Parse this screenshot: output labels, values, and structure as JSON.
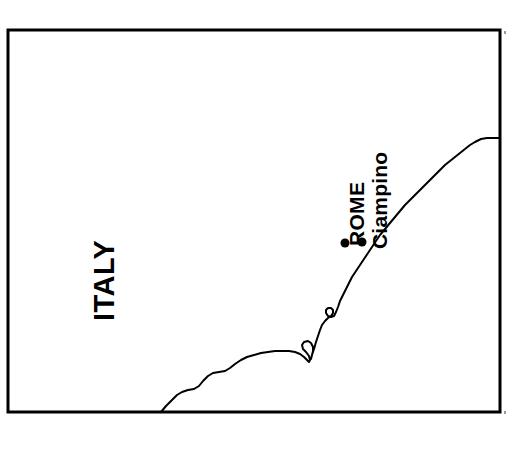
{
  "figure": {
    "type": "map",
    "background_color": "#ffffff",
    "line_color": "#000000",
    "width": 526,
    "height": 459
  },
  "frame": {
    "name": "map-border",
    "x": 8,
    "y": 30,
    "width": 492,
    "height": 382,
    "stroke_width": 3,
    "stroke_color": "#000000"
  },
  "labels": {
    "country": "ITALY",
    "city": "ROME",
    "airport": "Ciampino"
  },
  "markers": [
    {
      "name": "rome-marker",
      "label": "ROME",
      "x": 345,
      "y": 243,
      "radius": 4.5
    },
    {
      "name": "ciampino-marker",
      "label": "Ciampino",
      "x": 362,
      "y": 242,
      "radius": 4.5
    }
  ],
  "coastline": {
    "name": "tyrrhenian-coastline",
    "stroke_width": 2,
    "stroke_color": "#000000",
    "description": "Tyrrhenian coast of central Italy running from the lower-left border up to the right border",
    "points": [
      [
        161,
        412
      ],
      [
        166,
        406
      ],
      [
        172,
        400
      ],
      [
        177,
        395
      ],
      [
        182,
        392
      ],
      [
        188,
        390
      ],
      [
        194,
        389
      ],
      [
        199,
        386
      ],
      [
        203,
        381
      ],
      [
        208,
        376
      ],
      [
        213,
        373
      ],
      [
        219,
        372
      ],
      [
        225,
        371
      ],
      [
        230,
        368
      ],
      [
        235,
        364
      ],
      [
        241,
        360
      ],
      [
        247,
        357
      ],
      [
        254,
        355
      ],
      [
        261,
        353
      ],
      [
        268,
        352
      ],
      [
        275,
        351
      ],
      [
        282,
        351
      ],
      [
        289,
        351
      ],
      [
        295,
        352
      ],
      [
        300,
        354
      ],
      [
        304,
        357
      ],
      [
        307,
        360
      ],
      [
        309,
        362
      ],
      [
        310,
        360
      ],
      [
        309,
        356
      ],
      [
        306,
        352
      ],
      [
        303,
        349
      ],
      [
        302,
        345
      ],
      [
        304,
        342
      ],
      [
        308,
        341
      ],
      [
        311,
        343
      ],
      [
        313,
        347
      ],
      [
        313,
        351
      ],
      [
        312,
        355
      ],
      [
        311,
        359
      ],
      [
        312,
        355
      ],
      [
        314,
        349
      ],
      [
        316,
        342
      ],
      [
        318,
        336
      ],
      [
        320,
        330
      ],
      [
        322,
        325
      ],
      [
        325,
        321
      ],
      [
        328,
        318
      ],
      [
        331,
        316
      ],
      [
        333,
        313
      ],
      [
        333,
        310
      ],
      [
        331,
        308
      ],
      [
        328,
        308
      ],
      [
        326,
        310
      ],
      [
        326,
        313
      ],
      [
        328,
        316
      ],
      [
        331,
        317
      ],
      [
        334,
        316
      ],
      [
        336,
        312
      ],
      [
        338,
        307
      ],
      [
        340,
        301
      ],
      [
        343,
        295
      ],
      [
        346,
        289
      ],
      [
        349,
        283
      ],
      [
        352,
        277
      ],
      [
        356,
        271
      ],
      [
        360,
        265
      ],
      [
        364,
        259
      ],
      [
        368,
        253
      ],
      [
        372,
        247
      ],
      [
        376,
        241
      ],
      [
        380,
        235
      ],
      [
        385,
        229
      ],
      [
        390,
        223
      ],
      [
        395,
        217
      ],
      [
        400,
        211
      ],
      [
        405,
        205
      ],
      [
        410,
        200
      ],
      [
        415,
        195
      ],
      [
        420,
        190
      ],
      [
        425,
        185
      ],
      [
        430,
        180
      ],
      [
        435,
        175
      ],
      [
        440,
        170
      ],
      [
        445,
        165
      ],
      [
        450,
        161
      ],
      [
        455,
        157
      ],
      [
        460,
        153
      ],
      [
        465,
        149
      ],
      [
        470,
        145
      ],
      [
        475,
        142
      ],
      [
        481,
        139
      ],
      [
        487,
        138
      ],
      [
        493,
        138
      ],
      [
        499,
        138
      ]
    ]
  },
  "tick_marks": [
    {
      "name": "corner-tick-top-right",
      "x": 504,
      "y": 31
    },
    {
      "name": "corner-tick-bottom-right",
      "x": 504,
      "y": 411
    }
  ]
}
